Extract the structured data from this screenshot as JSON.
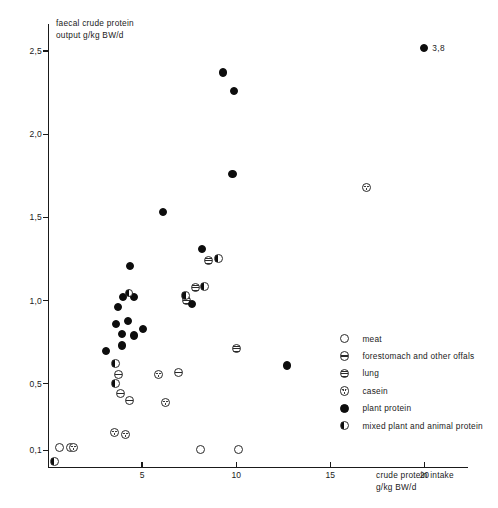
{
  "chart_data": {
    "type": "scatter",
    "title": "",
    "xlabel": "crude protein intake g/kg BW/d",
    "ylabel": "faecal crude protein output g/kg BW/d",
    "xlim": [
      0,
      22
    ],
    "ylim": [
      0,
      2.65
    ],
    "grid": false,
    "legend_position": "inside-right",
    "xticks": [
      5,
      10,
      15,
      20
    ],
    "xtick_labels": [
      "5",
      "10",
      "15",
      "20"
    ],
    "yticks": [
      0.1,
      0.5,
      1.0,
      1.5,
      2.0,
      2.5
    ],
    "ytick_labels": [
      "0,1",
      "0,5",
      "1,0",
      "1,5",
      "2,0",
      "2,5"
    ],
    "annotations": [
      {
        "text": "3,8",
        "x": 20.0,
        "y": 2.52
      }
    ],
    "series": [
      {
        "name": "meat",
        "marker": "open-circle",
        "points": [
          {
            "x": 0.6,
            "y": 0.115
          },
          {
            "x": 1.2,
            "y": 0.115
          },
          {
            "x": 8.1,
            "y": 0.105
          },
          {
            "x": 10.1,
            "y": 0.105
          }
        ]
      },
      {
        "name": "forestomach and other offals",
        "marker": "horizontal-band-circle",
        "points": [
          {
            "x": 3.85,
            "y": 0.44
          },
          {
            "x": 4.35,
            "y": 0.4
          },
          {
            "x": 6.95,
            "y": 0.57
          },
          {
            "x": 3.75,
            "y": 0.555
          }
        ]
      },
      {
        "name": "lung",
        "marker": "hatched-circle",
        "points": [
          {
            "x": 10.0,
            "y": 0.71
          },
          {
            "x": 8.55,
            "y": 1.24
          },
          {
            "x": 7.85,
            "y": 1.08
          },
          {
            "x": 7.35,
            "y": 1.0
          }
        ]
      },
      {
        "name": "casein",
        "marker": "dotted-circle",
        "points": [
          {
            "x": 1.35,
            "y": 0.115
          },
          {
            "x": 3.55,
            "y": 0.205
          },
          {
            "x": 4.1,
            "y": 0.195
          },
          {
            "x": 5.85,
            "y": 0.555
          },
          {
            "x": 6.25,
            "y": 0.385
          },
          {
            "x": 16.9,
            "y": 1.68
          }
        ]
      },
      {
        "name": "plant protein",
        "marker": "filled-circle",
        "points": [
          {
            "x": 20.0,
            "y": 2.52
          },
          {
            "x": 9.3,
            "y": 2.37
          },
          {
            "x": 9.9,
            "y": 2.26
          },
          {
            "x": 9.8,
            "y": 1.76
          },
          {
            "x": 6.1,
            "y": 1.53
          },
          {
            "x": 8.2,
            "y": 1.31
          },
          {
            "x": 4.35,
            "y": 1.21
          },
          {
            "x": 4.0,
            "y": 1.02
          },
          {
            "x": 4.55,
            "y": 1.02
          },
          {
            "x": 3.7,
            "y": 0.96
          },
          {
            "x": 7.65,
            "y": 0.98
          },
          {
            "x": 3.6,
            "y": 0.86
          },
          {
            "x": 4.25,
            "y": 0.875
          },
          {
            "x": 3.95,
            "y": 0.8
          },
          {
            "x": 4.55,
            "y": 0.79
          },
          {
            "x": 5.05,
            "y": 0.83
          },
          {
            "x": 3.95,
            "y": 0.73
          },
          {
            "x": 3.1,
            "y": 0.695
          },
          {
            "x": 12.7,
            "y": 0.61
          }
        ]
      },
      {
        "name": "mixed plant and animal protein",
        "marker": "half-filled-circle",
        "points": [
          {
            "x": 4.3,
            "y": 1.045
          },
          {
            "x": 8.3,
            "y": 1.085
          },
          {
            "x": 7.3,
            "y": 1.03
          },
          {
            "x": 9.05,
            "y": 1.255
          },
          {
            "x": 3.6,
            "y": 0.62
          },
          {
            "x": 3.6,
            "y": 0.5
          },
          {
            "x": 0.35,
            "y": 0.035
          }
        ]
      }
    ]
  },
  "axes": {
    "y_title": "faecal crude protein\noutput g/kg BW/d",
    "x_title": "crude protein intake\ng/kg BW/d"
  },
  "legend": {
    "items": [
      {
        "label": "meat",
        "marker": "open-circle",
        "icon": "open-circle-marker-icon"
      },
      {
        "label": "forestomach and other offals",
        "marker": "horizontal-band-circle",
        "icon": "band-circle-marker-icon"
      },
      {
        "label": "lung",
        "marker": "hatched-circle",
        "icon": "hatched-circle-marker-icon"
      },
      {
        "label": "casein",
        "marker": "dotted-circle",
        "icon": "dotted-circle-marker-icon"
      },
      {
        "label": "plant protein",
        "marker": "filled-circle",
        "icon": "filled-circle-marker-icon"
      },
      {
        "label": "mixed plant and animal protein",
        "marker": "half-filled-circle",
        "icon": "half-filled-circle-marker-icon"
      }
    ]
  },
  "colors": {
    "background": "#ffffff",
    "ink": "#1a1a1a",
    "marker_fill": "#0d0d0d",
    "marker_stroke": "#2a2a2a"
  }
}
